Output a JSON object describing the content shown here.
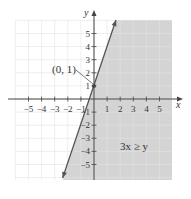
{
  "chart_data": {
    "type": "line",
    "title": "",
    "xlabel": "x",
    "ylabel": "y",
    "xlim": [
      -6,
      6
    ],
    "ylim": [
      -6,
      6
    ],
    "grid": true,
    "x_ticks": [
      -5,
      -4,
      -3,
      -2,
      -1,
      1,
      2,
      3,
      4,
      5
    ],
    "y_ticks": [
      -5,
      -4,
      -3,
      -2,
      -1,
      1,
      2,
      3,
      4,
      5
    ],
    "x_tick_labels": [
      "−5",
      "−4",
      "−3",
      "−2",
      "−1",
      "1",
      "2",
      "3",
      "4",
      "5"
    ],
    "y_tick_labels": [
      "−5",
      "−4",
      "−3",
      "−2",
      "−1",
      "1",
      "2",
      "3",
      "4",
      "5"
    ],
    "series": [
      {
        "name": "boundary line",
        "style": "solid",
        "x": [
          -2,
          0,
          2
        ],
        "y": [
          -5,
          1,
          7
        ]
      }
    ],
    "shaded_region": "right of boundary line",
    "points": [
      {
        "label": "(0, 1)",
        "x": 0,
        "y": 1
      }
    ],
    "annotations": [
      {
        "text": "(0, 1)",
        "target": [
          0,
          1
        ]
      },
      {
        "text": "3x ≥ y",
        "position": [
          3.3,
          -3.5
        ]
      }
    ]
  },
  "labels": {
    "x_axis": "x",
    "y_axis": "y",
    "point": "(0, 1)",
    "inequality": "3x ≥ y"
  },
  "colors": {
    "shade": "#d4d4d4",
    "grid": "#e2e2e2",
    "axis": "#444444",
    "line": "#555555"
  }
}
